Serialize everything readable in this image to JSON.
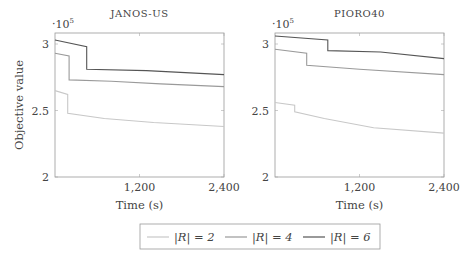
{
  "chart_data": [
    {
      "type": "line",
      "title": "JANOS-US",
      "xlabel": "Time (s)",
      "ylabel": "Objective value",
      "y_multiplier": "·10^5",
      "xlim": [
        0,
        2400
      ],
      "ylim": [
        2,
        3.05
      ],
      "xticks": [
        "1,200",
        "2,400"
      ],
      "yticks": [
        "2",
        "2.5",
        "3"
      ],
      "series": [
        {
          "name": "|R| = 2",
          "color": "#c8c8c8",
          "points": [
            [
              0,
              2.65
            ],
            [
              180,
              2.62
            ],
            [
              180,
              2.48
            ],
            [
              700,
              2.44
            ],
            [
              1400,
              2.41
            ],
            [
              2400,
              2.38
            ]
          ]
        },
        {
          "name": "|R| = 4",
          "color": "#9a9a9a",
          "points": [
            [
              0,
              2.93
            ],
            [
              200,
              2.91
            ],
            [
              200,
              2.73
            ],
            [
              800,
              2.72
            ],
            [
              1500,
              2.7
            ],
            [
              2400,
              2.68
            ]
          ]
        },
        {
          "name": "|R| = 6",
          "color": "#555555",
          "points": [
            [
              0,
              3.03
            ],
            [
              450,
              2.98
            ],
            [
              450,
              2.81
            ],
            [
              1300,
              2.8
            ],
            [
              2400,
              2.77
            ]
          ]
        }
      ]
    },
    {
      "type": "line",
      "title": "PIORO40",
      "xlabel": "Time (s)",
      "ylabel": "",
      "y_multiplier": "·10^5",
      "xlim": [
        0,
        2400
      ],
      "ylim": [
        2,
        3.05
      ],
      "xticks": [
        "1,200",
        "2,400"
      ],
      "yticks": [
        "2",
        "2.5",
        "3"
      ],
      "series": [
        {
          "name": "|R| = 2",
          "color": "#c8c8c8",
          "points": [
            [
              0,
              2.56
            ],
            [
              280,
              2.54
            ],
            [
              280,
              2.49
            ],
            [
              700,
              2.44
            ],
            [
              1400,
              2.37
            ],
            [
              2400,
              2.33
            ]
          ]
        },
        {
          "name": "|R| = 4",
          "color": "#9a9a9a",
          "points": [
            [
              0,
              2.96
            ],
            [
              450,
              2.93
            ],
            [
              450,
              2.84
            ],
            [
              1200,
              2.81
            ],
            [
              2400,
              2.77
            ]
          ]
        },
        {
          "name": "|R| = 6",
          "color": "#555555",
          "points": [
            [
              0,
              3.06
            ],
            [
              750,
              3.03
            ],
            [
              750,
              2.95
            ],
            [
              1500,
              2.94
            ],
            [
              2400,
              2.89
            ]
          ]
        }
      ]
    }
  ],
  "legend": [
    {
      "label": "|R| = 2",
      "color": "#c8c8c8"
    },
    {
      "label": "|R| = 4",
      "color": "#9a9a9a"
    },
    {
      "label": "|R| = 6",
      "color": "#555555"
    }
  ]
}
